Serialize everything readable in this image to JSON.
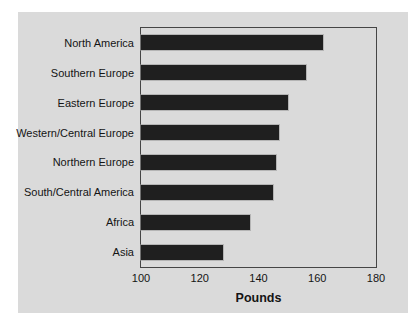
{
  "chart_data": {
    "type": "bar",
    "orientation": "horizontal",
    "title": "",
    "xlabel": "Pounds",
    "ylabel": "",
    "categories": [
      "North America",
      "Southern Europe",
      "Eastern Europe",
      "Western/Central Europe",
      "Northern Europe",
      "South/Central America",
      "Africa",
      "Asia"
    ],
    "values": [
      162,
      156,
      150,
      147,
      146,
      145,
      137,
      128
    ],
    "xlim": [
      100,
      180
    ],
    "xticks": [
      100,
      120,
      140,
      160,
      180
    ],
    "grid": false,
    "legend": false,
    "bar_color": "#1f1f1f",
    "panel_bg": "#dadada",
    "frame_color": "#454545"
  }
}
